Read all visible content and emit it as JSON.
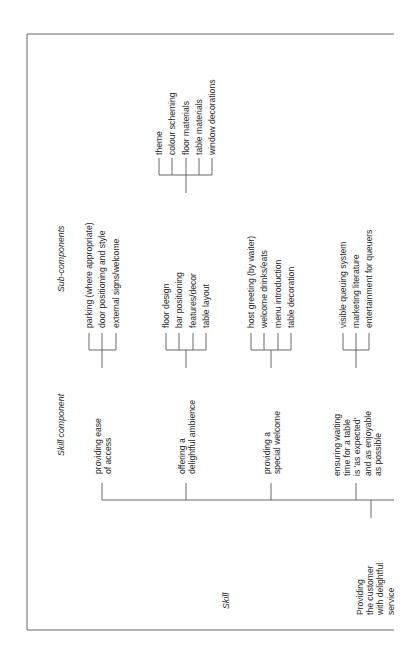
{
  "headers": {
    "skill": "Skill",
    "skill_component": "Skill component",
    "sub_components": "Sub-components"
  },
  "skill": {
    "label": "Providing\nthe customer\nwith delightful\nservice"
  },
  "skill_components": [
    {
      "label": "providing ease\nof access",
      "sub_components": [
        "parking (where appropriate)",
        "door positioning and style",
        "external signs/welcome"
      ]
    },
    {
      "label": "offering a\ndelightful ambience",
      "sub_components": [
        "floor design",
        "bar positioning",
        "features/decor",
        "table layout"
      ],
      "detail_group": [
        "theme",
        "colour scheming",
        "floor materials",
        "table materials",
        "window decorations"
      ]
    },
    {
      "label": "providing a\nspecial welcome",
      "sub_components": [
        "host greeting (by waiter)",
        "welcome drinks/eats",
        "menu introduction",
        "table decoration"
      ]
    },
    {
      "label": "ensuring waiting\ntime for a table\nis 'as expected'\nand as enjoyable\nas possible",
      "sub_components": [
        "visible queuing system",
        "marketing literature",
        "entertainment for queuers"
      ]
    }
  ],
  "colors": {
    "line": "#555555",
    "frame": "#666666",
    "text": "#2a2a2a"
  }
}
